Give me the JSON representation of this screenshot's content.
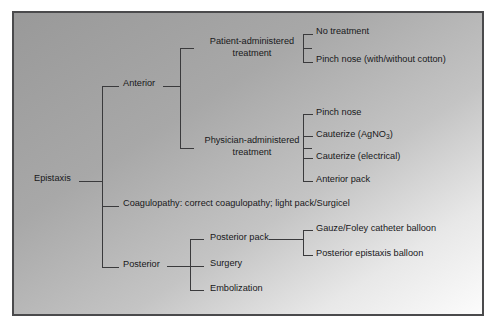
{
  "figure": {
    "frame": {
      "x": 13,
      "y": 12,
      "width": 470,
      "height": 303
    },
    "background": {
      "gradient_from": "#9c9c9c",
      "gradient_to": "#fbfbfb",
      "page": "#ffffff"
    },
    "line_color": "#3a3a3c",
    "text_color": "#18181a"
  },
  "diagram": {
    "type": "tree",
    "orientation": "left-to-right",
    "root": {
      "id": "epistaxis",
      "label": "Epistaxis",
      "x": 34,
      "y": 181,
      "anchor": "start"
    },
    "nodes": [
      {
        "id": "anterior",
        "label": "Anterior",
        "level": 1,
        "x": 123,
        "y": 86,
        "anchor": "start",
        "lines": [
          "Anterior"
        ]
      },
      {
        "id": "coagulopathy",
        "label": "Coagulopathy: correct coagulopathy; light pack/Surgicel",
        "level": 1,
        "x": 123,
        "y": 206,
        "anchor": "start",
        "lines": [
          "Coagulopathy: correct coagulopathy; light pack/Surgicel"
        ]
      },
      {
        "id": "posterior",
        "label": "Posterior",
        "level": 1,
        "x": 123,
        "y": 267,
        "anchor": "start",
        "lines": [
          "Posterior"
        ]
      },
      {
        "id": "patient-administered-treatment",
        "label": "Patient-administered treatment",
        "level": 2,
        "parent": "anterior",
        "x": 252,
        "y": 44,
        "anchor": "middle",
        "lines": [
          "Patient-administered",
          "treatment"
        ]
      },
      {
        "id": "physician-administered-treatment",
        "label": "Physician-administered treatment",
        "level": 2,
        "parent": "anterior",
        "x": 252,
        "y": 143,
        "anchor": "middle",
        "lines": [
          "Physician-administered",
          "treatment"
        ]
      },
      {
        "id": "no-treatment",
        "label": "No treatment",
        "level": 3,
        "parent": "patient-administered-treatment",
        "x": 316,
        "y": 34,
        "anchor": "start",
        "lines": [
          "No treatment"
        ]
      },
      {
        "id": "pinch-nose-cotton",
        "label": "Pinch nose (with/without cotton)",
        "level": 3,
        "parent": "patient-administered-treatment",
        "x": 316,
        "y": 62,
        "anchor": "start",
        "lines": [
          "Pinch nose (with/without cotton)"
        ]
      },
      {
        "id": "pinch-nose",
        "label": "Pinch nose",
        "level": 3,
        "parent": "physician-administered-treatment",
        "x": 316,
        "y": 115,
        "anchor": "start",
        "lines": [
          "Pinch nose"
        ]
      },
      {
        "id": "cauterize-agno3",
        "label": "Cauterize (AgNO3)",
        "level": 3,
        "parent": "physician-administered-treatment",
        "x": 316,
        "y": 137,
        "anchor": "start",
        "rich": [
          {
            "t": "Cauterize (AgNO"
          },
          {
            "t": "3",
            "sub": true
          },
          {
            "t": ")"
          }
        ]
      },
      {
        "id": "cauterize-electrical",
        "label": "Cauterize (electrical)",
        "level": 3,
        "parent": "physician-administered-treatment",
        "x": 316,
        "y": 159,
        "anchor": "start",
        "lines": [
          "Cauterize (electrical)"
        ]
      },
      {
        "id": "anterior-pack",
        "label": "Anterior pack",
        "level": 3,
        "parent": "physician-administered-treatment",
        "x": 316,
        "y": 182,
        "anchor": "start",
        "lines": [
          "Anterior pack"
        ]
      },
      {
        "id": "posterior-pack",
        "label": "Posterior pack",
        "level": 2,
        "parent": "posterior",
        "x": 210,
        "y": 240,
        "anchor": "start",
        "lines": [
          "Posterior pack"
        ]
      },
      {
        "id": "surgery",
        "label": "Surgery",
        "level": 2,
        "parent": "posterior",
        "x": 210,
        "y": 266,
        "anchor": "start",
        "lines": [
          "Surgery"
        ]
      },
      {
        "id": "embolization",
        "label": "Embolization",
        "level": 2,
        "parent": "posterior",
        "x": 210,
        "y": 291,
        "anchor": "start",
        "lines": [
          "Embolization"
        ]
      },
      {
        "id": "gauze-foley-catheter-balloon",
        "label": "Gauze/Foley catheter balloon",
        "level": 3,
        "parent": "posterior-pack",
        "x": 316,
        "y": 231,
        "anchor": "start",
        "lines": [
          "Gauze/Foley catheter balloon"
        ]
      },
      {
        "id": "posterior-epistaxis-balloon",
        "label": "Posterior epistaxis balloon",
        "level": 3,
        "parent": "posterior-pack",
        "x": 316,
        "y": 256,
        "anchor": "start",
        "lines": [
          "Posterior epistaxis balloon"
        ]
      }
    ],
    "connectors": [
      {
        "id": "root-stub",
        "from": "epistaxis",
        "to": "trunk",
        "d": "M 79 181 L 102 181"
      },
      {
        "id": "trunk-vertical",
        "from": "trunk",
        "to": "level1",
        "d": "M 102 86 L 102 267"
      },
      {
        "id": "stub-anterior",
        "from": "trunk",
        "to": "anterior",
        "d": "M 102 86 L 119 86"
      },
      {
        "id": "stub-coagulopathy",
        "from": "trunk",
        "to": "coagulopathy",
        "d": "M 102 206 L 119 206"
      },
      {
        "id": "stub-posterior",
        "from": "trunk",
        "to": "posterior",
        "d": "M 102 267 L 119 267"
      },
      {
        "id": "anterior-out",
        "from": "anterior",
        "to": "anterior-bus",
        "d": "M 163 86 L 180 86"
      },
      {
        "id": "anterior-bus",
        "from": "anterior-bus",
        "to": "level2",
        "d": "M 180 48 L 180 148"
      },
      {
        "id": "stub-patient",
        "from": "anterior-bus",
        "to": "patient-administered-treatment",
        "d": "M 180 48 L 194 48"
      },
      {
        "id": "stub-physician",
        "from": "anterior-bus",
        "to": "physician-administered-treatment",
        "d": "M 180 148 L 194 148"
      },
      {
        "id": "patient-out",
        "from": "patient-administered-treatment",
        "to": "patient-bus",
        "d": "M 312 48 L 303 48"
      },
      {
        "id": "patient-bus",
        "from": "patient-bus",
        "to": "level3",
        "d": "M 303 34 L 303 62"
      },
      {
        "id": "stub-no-treatment",
        "from": "patient-bus",
        "to": "no-treatment",
        "d": "M 303 34 L 313 34"
      },
      {
        "id": "stub-pinch-cotton",
        "from": "patient-bus",
        "to": "pinch-nose-cotton",
        "d": "M 303 62 L 313 62"
      },
      {
        "id": "physician-out",
        "from": "physician-administered-treatment",
        "to": "physician-bus",
        "d": "M 312 148 L 303 148"
      },
      {
        "id": "physician-bus",
        "from": "physician-bus",
        "to": "level3",
        "d": "M 303 114 L 303 181"
      },
      {
        "id": "stub-pinch-nose",
        "from": "physician-bus",
        "to": "pinch-nose",
        "d": "M 303 114 L 313 114"
      },
      {
        "id": "stub-cauterize-agno3",
        "from": "physician-bus",
        "to": "cauterize-agno3",
        "d": "M 303 136 L 313 136"
      },
      {
        "id": "stub-cauterize-electrical",
        "from": "physician-bus",
        "to": "cauterize-electrical",
        "d": "M 303 158 L 313 158"
      },
      {
        "id": "stub-anterior-pack",
        "from": "physician-bus",
        "to": "anterior-pack",
        "d": "M 303 181 L 313 181"
      },
      {
        "id": "posterior-out",
        "from": "posterior",
        "to": "posterior-bus",
        "d": "M 167 266 L 190 266"
      },
      {
        "id": "posterior-bus",
        "from": "posterior-bus",
        "to": "level2",
        "d": "M 190 239 L 190 290"
      },
      {
        "id": "stub-posterior-pack",
        "from": "posterior-bus",
        "to": "posterior-pack",
        "d": "M 190 239 L 204 239"
      },
      {
        "id": "stub-surgery",
        "from": "posterior-bus",
        "to": "surgery",
        "d": "M 190 266 L 204 266"
      },
      {
        "id": "stub-embolization",
        "from": "posterior-bus",
        "to": "embolization",
        "d": "M 190 290 L 204 290"
      },
      {
        "id": "posterior-pack-out",
        "from": "posterior-pack",
        "to": "posterior-pack-bus",
        "d": "M 269 239 L 303 239"
      },
      {
        "id": "posterior-pack-bus",
        "from": "posterior-pack-bus",
        "to": "level3",
        "d": "M 303 230 L 303 255"
      },
      {
        "id": "stub-gauze",
        "from": "posterior-pack-bus",
        "to": "gauze-foley-catheter-balloon",
        "d": "M 303 230 L 313 230"
      },
      {
        "id": "stub-post-balloon",
        "from": "posterior-pack-bus",
        "to": "posterior-epistaxis-balloon",
        "d": "M 303 255 L 313 255"
      }
    ]
  }
}
